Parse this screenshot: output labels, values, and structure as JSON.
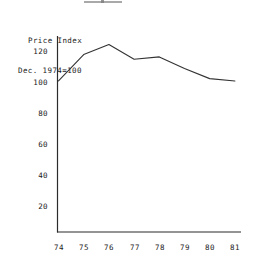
{
  "chart_data": {
    "type": "line",
    "title": "",
    "xlabel": "",
    "ylabel": "Price Index Dec. 1974=100",
    "ylabel_line1": "Price Index",
    "ylabel_line2": "Dec. 1974=100",
    "categories": [
      "74",
      "75",
      "76",
      "77",
      "78",
      "79",
      "80",
      "81"
    ],
    "x": [
      74,
      75,
      76,
      77,
      78,
      79,
      80,
      81
    ],
    "values": [
      101,
      118,
      124.5,
      115,
      116.5,
      109,
      102.5,
      101
    ],
    "series": [
      {
        "name": "Price Index",
        "values": [
          101,
          118,
          124.5,
          115,
          116.5,
          109,
          102.5,
          101
        ]
      }
    ],
    "ylim": [
      0,
      130
    ],
    "yticks": [
      20,
      40,
      60,
      80,
      100,
      120
    ],
    "ytick_labels": [
      "20",
      "40",
      "60",
      "80",
      "100",
      "120"
    ],
    "xtick_labels": [
      "74",
      "75",
      "76",
      "77",
      "78",
      "79",
      "80",
      "81"
    ],
    "grid": false,
    "legend": "none",
    "line_color": "#333333"
  },
  "axis": {
    "y_title_line1": "Price Index",
    "y_title_line2": "Dec. 1974=100"
  }
}
